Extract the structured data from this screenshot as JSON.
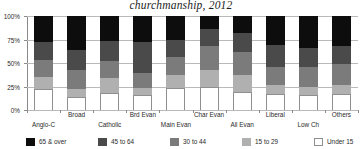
{
  "chart_data": {
    "type": "bar",
    "variant": "stacked-100-percent",
    "title": "churchmanship, 2012",
    "xlabel": "",
    "ylabel": "",
    "ylim": [
      0,
      100
    ],
    "ytick_labels": [
      "0%",
      "25%",
      "50%",
      "75%",
      "100%"
    ],
    "ytick_values": [
      0,
      25,
      50,
      75,
      100
    ],
    "grid": true,
    "legend_position": "bottom",
    "stack_order_bottom_to_top": [
      "Under 15",
      "15 to 29",
      "30 to 44",
      "45 to 64",
      "65 & over"
    ],
    "categories": [
      "Anglo-C",
      "Broad",
      "Catholic",
      "Brd Evan",
      "Main Evan",
      "Char Evan",
      "All Evan",
      "Liberal",
      "Low Ch",
      "Others"
    ],
    "series": [
      {
        "name": "Under 15",
        "color": "#ffffff",
        "values": [
          22,
          14,
          18,
          16,
          23,
          25,
          19,
          17,
          16,
          17
        ]
      },
      {
        "name": "15 to 29",
        "color": "#b0b0b0",
        "values": [
          13,
          8,
          16,
          7,
          14,
          18,
          18,
          10,
          9,
          10
        ]
      },
      {
        "name": "30 to 44",
        "color": "#7b7b7b",
        "values": [
          18,
          21,
          18,
          16,
          19,
          25,
          25,
          19,
          21,
          22
        ]
      },
      {
        "name": "45 to 64",
        "color": "#4a4a4a",
        "values": [
          19,
          21,
          21,
          33,
          18,
          18,
          20,
          23,
          20,
          19
        ]
      },
      {
        "name": "65 & over",
        "color": "#0d0d0d",
        "values": [
          28,
          36,
          27,
          28,
          26,
          14,
          18,
          31,
          34,
          32
        ]
      }
    ]
  },
  "legend": {
    "items": [
      {
        "label": "65 & over",
        "color": "#0d0d0d"
      },
      {
        "label": "45 to 64",
        "color": "#4a4a4a"
      },
      {
        "label": "30 to 44",
        "color": "#7b7b7b"
      },
      {
        "label": "15 to 29",
        "color": "#b0b0b0"
      },
      {
        "label": "Under 15",
        "color": "#ffffff"
      }
    ]
  }
}
